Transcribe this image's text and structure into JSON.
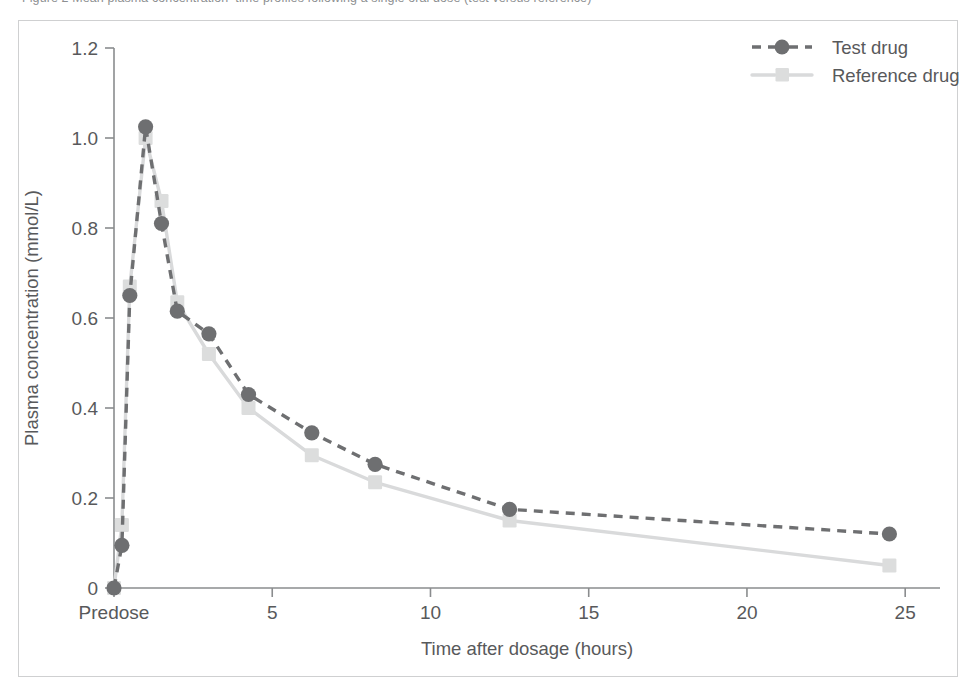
{
  "caption": {
    "text": "Figure 2  Mean plasma concentration–time profiles following a single oral dose (test versus reference)"
  },
  "chart_data": {
    "type": "line",
    "title": "",
    "xlabel": "Time after dosage (hours)",
    "ylabel": "Plasma concentration (mmol/L)",
    "xlim": [
      0,
      26.1
    ],
    "ylim": [
      0,
      1.2
    ],
    "grid": false,
    "legend_position": "top-right",
    "x_ticks": [
      {
        "value": 0,
        "label": "Predose"
      },
      {
        "value": 5,
        "label": "5"
      },
      {
        "value": 10,
        "label": "10"
      },
      {
        "value": 15,
        "label": "15"
      },
      {
        "value": 20,
        "label": "20"
      },
      {
        "value": 25,
        "label": "25"
      }
    ],
    "y_ticks": [
      {
        "value": 0,
        "label": "0"
      },
      {
        "value": 0.2,
        "label": "0.2"
      },
      {
        "value": 0.4,
        "label": "0.4"
      },
      {
        "value": 0.6,
        "label": "0.6"
      },
      {
        "value": 0.8,
        "label": "0.8"
      },
      {
        "value": 1.0,
        "label": "1.0"
      },
      {
        "value": 1.2,
        "label": "1.2"
      }
    ],
    "x": [
      0,
      0.25,
      0.5,
      1,
      1.5,
      2,
      3,
      4.25,
      6.25,
      8.25,
      12.5,
      24.5
    ],
    "series": [
      {
        "name": "Test drug",
        "color": "#6e6f71",
        "marker": "circle",
        "linestyle": "dashed",
        "values": [
          0,
          0.095,
          0.65,
          1.025,
          0.81,
          0.615,
          0.565,
          0.43,
          0.345,
          0.275,
          0.175,
          0.12
        ]
      },
      {
        "name": "Reference drug",
        "color": "#dcdddd",
        "marker": "square",
        "linestyle": "solid",
        "values": [
          0,
          0.14,
          0.67,
          1.0,
          0.86,
          0.635,
          0.52,
          0.4,
          0.295,
          0.235,
          0.15,
          0.05
        ]
      }
    ]
  },
  "legend": {
    "items": [
      {
        "label": "Test drug",
        "marker": "circle",
        "color": "#6e6f71",
        "linestyle": "dashed"
      },
      {
        "label": "Reference drug",
        "marker": "square",
        "color": "#dcdddd",
        "linestyle": "solid"
      }
    ]
  },
  "colors": {
    "test_drug": "#6e6f71",
    "reference_drug": "#dcdddd",
    "axis": "#8a8c8e",
    "frame": "#cfd0d1",
    "text": "#58595b"
  }
}
